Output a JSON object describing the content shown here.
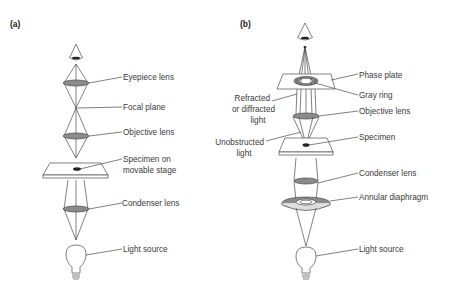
{
  "panels": [
    {
      "id": "a",
      "label": "(a)",
      "title": "Bright-field microscope light path",
      "labels": {
        "eyepiece": "Eyepiece lens",
        "focal": "Focal plane",
        "objective": "Objective lens",
        "specimen_1": "Specimen on",
        "specimen_2": "movable stage",
        "condenser": "Condenser lens",
        "light": "Light source"
      }
    },
    {
      "id": "b",
      "label": "(b)",
      "title": "Phase-contrast microscope light path",
      "labels": {
        "phase_plate": "Phase plate",
        "gray_ring": "Gray ring",
        "refracted_1": "Refracted",
        "refracted_2": "or diffracted",
        "refracted_3": "light",
        "objective": "Objective lens",
        "unobstructed_1": "Unobstructed",
        "unobstructed_2": "light",
        "specimen": "Specimen",
        "condenser": "Condenser lens",
        "annular": "Annular diaphragm",
        "light": "Light source"
      }
    }
  ],
  "colors": {
    "line": "#4a4a4a",
    "lens_fill": "#8a8a8a",
    "text": "#3a3a3a"
  }
}
